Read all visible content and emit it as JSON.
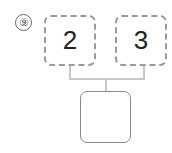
{
  "problem": {
    "number": "⑨"
  },
  "diagram": {
    "parts": [
      "2",
      "3"
    ],
    "answer": ""
  }
}
